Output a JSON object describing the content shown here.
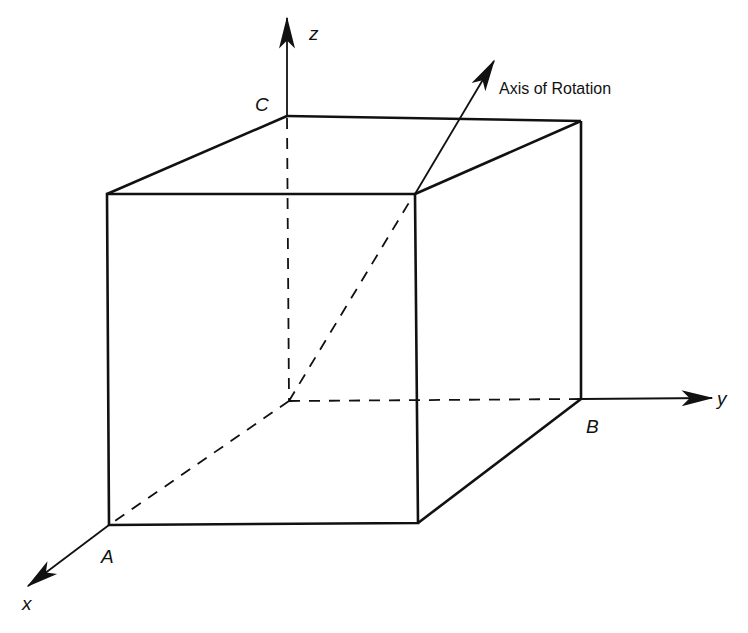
{
  "diagram": {
    "type": "3d-cube-with-axes",
    "colors": {
      "line": "#111111",
      "background": "#ffffff"
    },
    "axes": [
      {
        "name": "z",
        "label": "z",
        "direction": "up"
      },
      {
        "name": "y",
        "label": "y",
        "direction": "right"
      },
      {
        "name": "x",
        "label": "x",
        "direction": "down-left"
      }
    ],
    "points": [
      {
        "id": "A",
        "label": "A"
      },
      {
        "id": "B",
        "label": "B"
      },
      {
        "id": "C",
        "label": "C"
      }
    ],
    "annotation": {
      "label": "Axis of Rotation"
    },
    "hidden_edges": "dashed"
  }
}
